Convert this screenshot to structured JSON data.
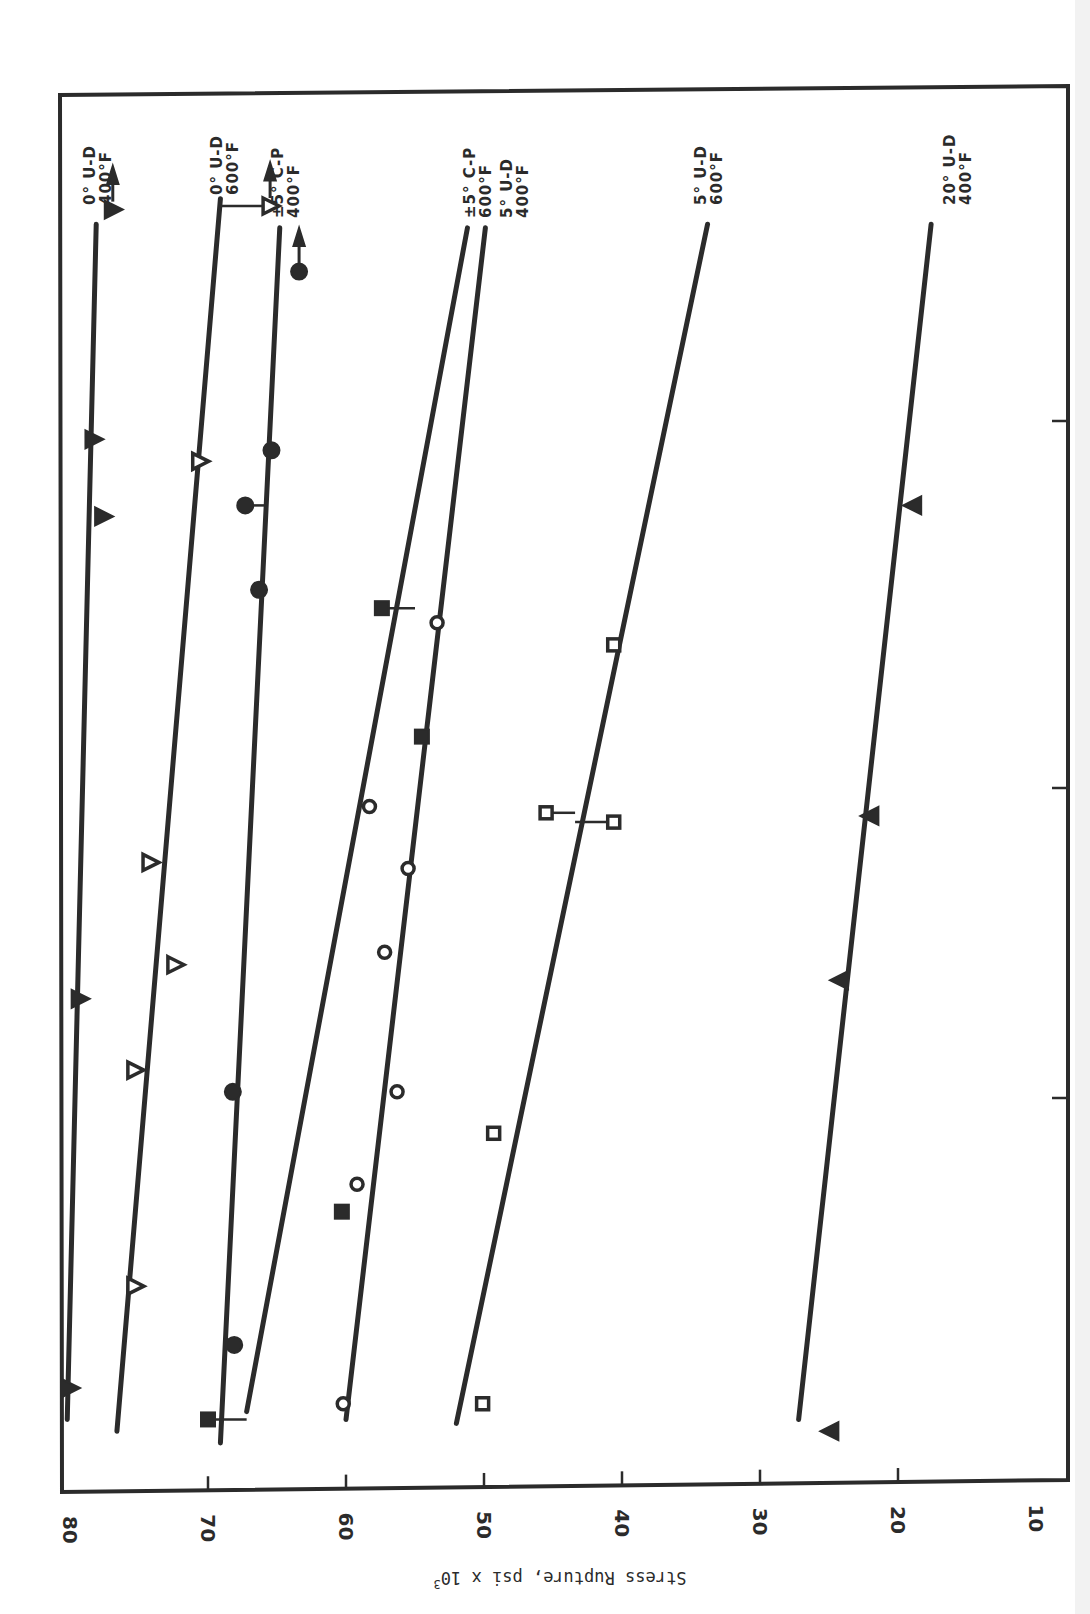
{
  "chart_data": {
    "type": "scatter",
    "orientation_note": "figure printed rotated 90 degrees; stress axis along bottom edge, time axis (log decades, unlabeled) along vertical",
    "title": "",
    "xlabel": "Stress Rupture, psi x 10^3",
    "xlabel_main": "Stress Rupture, psi x 10",
    "xlabel_sup": "3",
    "ylabel": "",
    "x_ticks": [
      80,
      70,
      60,
      50,
      40,
      30,
      20,
      10
    ],
    "xlim": [
      80,
      10
    ],
    "y_scale": "log (unlabeled decades)",
    "y_ticks_decades": [
      1,
      2,
      3
    ],
    "series": [
      {
        "name": "0° U-D 400°F",
        "label_line1": "0° U-D",
        "label_line2": "400°F",
        "marker": "filled-triangle",
        "fit": [
          [
            80.2,
            0.18
          ],
          [
            78.1,
            3.54
          ]
        ],
        "points": [
          {
            "stress": 80.0,
            "log_time": 0.26
          },
          {
            "stress": 79.3,
            "log_time": 1.32
          },
          {
            "stress": 78.3,
            "log_time": 2.95
          },
          {
            "stress": 77.6,
            "log_time": 2.74
          },
          {
            "stress": 76.9,
            "log_time": 3.58,
            "runout": true
          }
        ]
      },
      {
        "name": "0° U-D 600°F",
        "label_line1": "0° U-D",
        "label_line2": "600°F",
        "marker": "open-triangle",
        "fit": [
          [
            76.6,
            0.15
          ],
          [
            69.1,
            3.61
          ]
        ],
        "points": [
          {
            "stress": 75.3,
            "log_time": 0.52
          },
          {
            "stress": 75.3,
            "log_time": 1.09
          },
          {
            "stress": 72.4,
            "log_time": 1.43
          },
          {
            "stress": 74.2,
            "log_time": 1.76
          },
          {
            "stress": 70.6,
            "log_time": 2.89
          },
          {
            "stress": 65.5,
            "log_time": 3.59,
            "runout": true,
            "bracket_to": 69.1
          }
        ]
      },
      {
        "name": "±5° C-P 400°F",
        "label_line1": "±5° C-P",
        "label_line2": "400°F",
        "marker": "filled-circle",
        "fit": [
          [
            69.1,
            0.12
          ],
          [
            64.8,
            3.53
          ]
        ],
        "points": [
          {
            "stress": 68.1,
            "log_time": 0.37
          },
          {
            "stress": 68.2,
            "log_time": 1.02
          },
          {
            "stress": 66.3,
            "log_time": 2.54
          },
          {
            "stress": 67.3,
            "log_time": 2.77,
            "bracket_to": 65.9
          },
          {
            "stress": 65.4,
            "log_time": 2.92
          },
          {
            "stress": 63.4,
            "log_time": 3.41,
            "runout": true
          }
        ]
      },
      {
        "name": "±5° C-P 600°F",
        "label_line1": "±5° C-P",
        "label_line2": "600°F",
        "marker": "filled-square",
        "fit": [
          [
            67.2,
            0.2
          ],
          [
            51.2,
            3.53
          ]
        ],
        "points": [
          {
            "stress": 70.0,
            "log_time": 0.18,
            "bracket_to": 67.2
          },
          {
            "stress": 60.3,
            "log_time": 0.71
          },
          {
            "stress": 54.5,
            "log_time": 2.14
          },
          {
            "stress": 57.4,
            "log_time": 2.49,
            "bracket_to": 55.0
          }
        ]
      },
      {
        "name": "5° U-D 400°F",
        "label_line1": "5° U-D",
        "label_line2": "400°F",
        "marker": "open-circle",
        "fit": [
          [
            60.0,
            0.18
          ],
          [
            49.9,
            3.53
          ]
        ],
        "points": [
          {
            "stress": 60.2,
            "log_time": 0.22
          },
          {
            "stress": 59.2,
            "log_time": 0.78
          },
          {
            "stress": 56.3,
            "log_time": 1.02
          },
          {
            "stress": 57.2,
            "log_time": 1.47
          },
          {
            "stress": 55.5,
            "log_time": 1.74
          },
          {
            "stress": 58.3,
            "log_time": 1.94
          },
          {
            "stress": 53.4,
            "log_time": 2.45
          }
        ]
      },
      {
        "name": "5° U-D 600°F",
        "label_line1": "5° U-D",
        "label_line2": "600°F",
        "marker": "open-square",
        "fit": [
          [
            52.0,
            0.17
          ],
          [
            33.8,
            3.54
          ]
        ],
        "points": [
          {
            "stress": 50.1,
            "log_time": 0.22
          },
          {
            "stress": 49.3,
            "log_time": 0.91
          },
          {
            "stress": 45.5,
            "log_time": 1.92,
            "bracket_to": 43.4
          },
          {
            "stress": 40.6,
            "log_time": 1.89,
            "bracket_to": 43.4
          },
          {
            "stress": 40.6,
            "log_time": 2.39
          }
        ]
      },
      {
        "name": "20° U-D 400°F",
        "label_line1": "20° U-D",
        "label_line2": "400°F",
        "marker": "filled-triangle-left",
        "fit": [
          [
            27.2,
            0.18
          ],
          [
            17.6,
            3.54
          ]
        ],
        "points": [
          {
            "stress": 24.9,
            "log_time": 0.15
          },
          {
            "stress": 24.2,
            "log_time": 1.38
          },
          {
            "stress": 22.0,
            "log_time": 1.91
          },
          {
            "stress": 18.9,
            "log_time": 2.77
          }
        ]
      }
    ],
    "legend_position": "labels at top of each fit line"
  },
  "layout": {
    "frame": {
      "left": 60,
      "top": 93,
      "right": 1068,
      "bottom_left": 1492,
      "bottom_right": 1480
    },
    "stress_axis": {
      "x_at_80": 70,
      "px_per_ksi": 13.8
    },
    "time_axis": {
      "breakpoints": [
        [
          0,
          1490
        ],
        [
          1,
          1098
        ],
        [
          2,
          788
        ],
        [
          3,
          421
        ],
        [
          3.9,
          93
        ]
      ]
    },
    "label_positions": [
      {
        "x": 95,
        "y": 205
      },
      {
        "x": 222,
        "y": 195
      },
      {
        "x": 283,
        "y": 218
      },
      {
        "x": 475,
        "y": 218
      },
      {
        "x": 512,
        "y": 218
      },
      {
        "x": 706,
        "y": 205
      },
      {
        "x": 955,
        "y": 205
      }
    ]
  }
}
